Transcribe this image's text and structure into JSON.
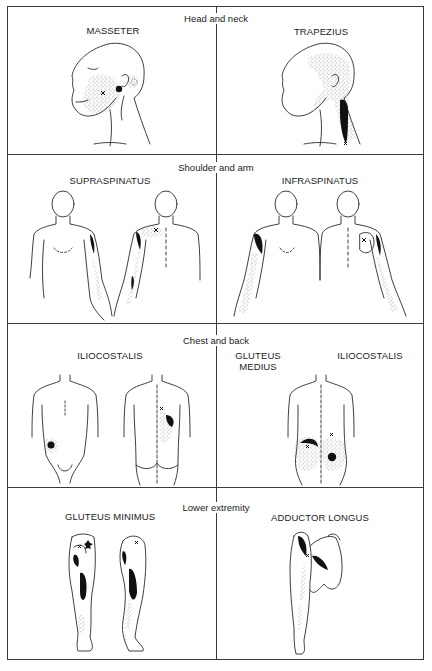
{
  "figure": {
    "sections": [
      {
        "title": "Head and neck",
        "panels": [
          {
            "label": "MASSETER",
            "views": [
              "head-left-profile"
            ]
          },
          {
            "label": "TRAPEZIUS",
            "views": [
              "head-left-profile"
            ]
          }
        ]
      },
      {
        "title": "Shoulder and arm",
        "panels": [
          {
            "label": "SUPRASPINATUS",
            "views": [
              "torso-front",
              "torso-back"
            ]
          },
          {
            "label": "INFRASPINATUS",
            "views": [
              "torso-front",
              "torso-back"
            ]
          }
        ]
      },
      {
        "title": "Chest and back",
        "panels": [
          {
            "label": "ILIOCOSTALIS",
            "views": [
              "torso-front",
              "torso-back"
            ]
          },
          {
            "label": "GLUTEUS MEDIUS",
            "label_lines": [
              "GLUTEUS",
              "MEDIUS"
            ],
            "second_label": "ILIOCOSTALIS",
            "views": [
              "torso-back"
            ]
          }
        ]
      },
      {
        "title": "Lower extremity",
        "panels": [
          {
            "label": "GLUTEUS MINIMUS",
            "views": [
              "leg-back",
              "leg-side"
            ]
          },
          {
            "label": "ADDUCTOR LONGUS",
            "views": [
              "leg-front-raised"
            ]
          }
        ]
      }
    ]
  },
  "labels": {
    "s1_title": "Head and neck",
    "s1_left": "MASSETER",
    "s1_right": "TRAPEZIUS",
    "s2_title": "Shoulder and arm",
    "s2_left": "SUPRASPINATUS",
    "s2_right": "INFRASPINATUS",
    "s3_title": "Chest and back",
    "s3_left": "ILIOCOSTALIS",
    "s3_right_a1": "GLUTEUS",
    "s3_right_a2": "MEDIUS",
    "s3_right_b": "ILIOCOSTALIS",
    "s4_title": "Lower extremity",
    "s4_left": "GLUTEUS MINIMUS",
    "s4_right": "ADDUCTOR LONGUS"
  },
  "legend": {
    "x_mark": "trigger point",
    "solid_fill": "essential referred pain zone",
    "stipple": "spillover pain zone"
  },
  "colors": {
    "line": "#2a2a2a",
    "background": "#ffffff",
    "fill": "#111111"
  }
}
